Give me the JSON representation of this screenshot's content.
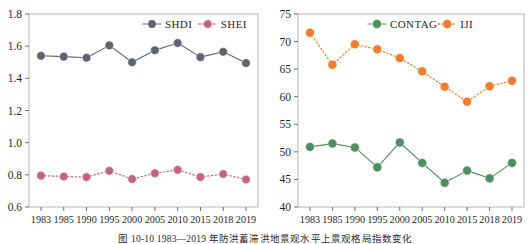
{
  "figure": {
    "caption": "图 10-10   1983—2019 年防洪蓄滞洪地景观水平上景观格局指数变化"
  },
  "chart_data": [
    {
      "type": "line",
      "title": "",
      "xlabel": "",
      "ylabel": "",
      "categories": [
        "1983",
        "1985",
        "1990",
        "1995",
        "2000",
        "2005",
        "2010",
        "2015",
        "2018",
        "2019"
      ],
      "ylim": [
        0.6,
        1.8
      ],
      "yticks": [
        "0.6",
        "0.8",
        "1.0",
        "1.2",
        "1.4",
        "1.6",
        "1.8"
      ],
      "grid": false,
      "legend_position": "top-right",
      "series": [
        {
          "name": "SHDI",
          "color": "#5f6274",
          "linestyle": "solid",
          "marker": "circle",
          "values": [
            1.54,
            1.535,
            1.528,
            1.605,
            1.5,
            1.575,
            1.62,
            1.532,
            1.565,
            1.495
          ]
        },
        {
          "name": "SHEI",
          "color": "#c4657c",
          "linestyle": "dotted",
          "marker": "circle",
          "values": [
            0.795,
            0.79,
            0.786,
            0.825,
            0.774,
            0.81,
            0.831,
            0.786,
            0.805,
            0.771
          ]
        }
      ]
    },
    {
      "type": "line",
      "title": "",
      "xlabel": "",
      "ylabel": "",
      "categories": [
        "1983",
        "1985",
        "1990",
        "1995",
        "2000",
        "2005",
        "2010",
        "2015",
        "2018",
        "2019"
      ],
      "ylim": [
        40,
        75
      ],
      "yticks": [
        "40",
        "45",
        "50",
        "55",
        "60",
        "65",
        "70",
        "75"
      ],
      "grid": false,
      "legend_position": "top-right",
      "series": [
        {
          "name": "CONTAG",
          "color": "#4f8f5f",
          "linestyle": "solid",
          "marker": "circle",
          "values": [
            50.9,
            51.5,
            50.8,
            47.2,
            51.7,
            48.0,
            44.4,
            46.6,
            45.2,
            48.0
          ]
        },
        {
          "name": "IJI",
          "color": "#f07d2b",
          "linestyle": "dotted",
          "marker": "circle",
          "values": [
            71.6,
            65.8,
            69.5,
            68.6,
            67.0,
            64.6,
            61.8,
            59.1,
            61.9,
            62.9
          ]
        }
      ]
    }
  ]
}
